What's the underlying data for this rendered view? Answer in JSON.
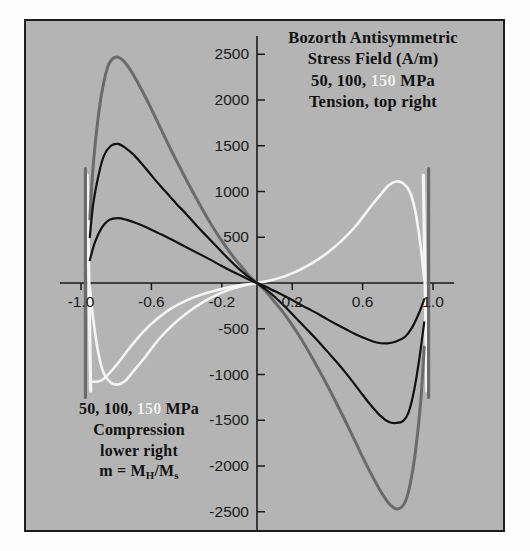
{
  "figure": {
    "background_color": "#b4b4b4",
    "border_color": "#1d1d1d",
    "page_color": "#ffffff"
  },
  "title": {
    "line1": "Bozorth Antisymmetric",
    "line2": "Stress Field (A/m)",
    "line3_part1": "50, 100,",
    "line3_highlight": "150",
    "line3_part2": "MPa",
    "line4": "Tension, top right"
  },
  "note": {
    "line1_part1": "50, 100,",
    "line1_highlight": "150",
    "line1_part2": "MPa",
    "line2": "Compression",
    "line3": "lower right",
    "line4_prefix": "m = M",
    "line4_sub1": "H",
    "line4_mid": "/M",
    "line4_sub2": "s"
  },
  "chart_data": {
    "type": "line",
    "title": "Bozorth Antisymmetric Stress Field (A/m)",
    "xlabel": "m = MH/Ms",
    "ylabel": "Stress Field (A/m)",
    "xlim": [
      -1.12,
      1.12
    ],
    "ylim": [
      -2700,
      2700
    ],
    "grid": false,
    "legend_position": "none",
    "xticks": [
      -1.0,
      -0.6,
      -0.2,
      0.2,
      0.6,
      1.0
    ],
    "xtick_labels": [
      "-1.0",
      "-0.6",
      "-0.2",
      "0.2",
      "0.6",
      "1.0"
    ],
    "yticks": [
      2500,
      2000,
      1500,
      1000,
      500,
      -500,
      -1000,
      -1500,
      -2000,
      -2500
    ],
    "ytick_labels": [
      "2500",
      "2000",
      "1500",
      "1000",
      "500",
      "-500",
      "-1000",
      "-1500",
      "-2000",
      "-2500"
    ],
    "series": [
      {
        "name": "150 MPa (dark)",
        "color": "#6b6b6b",
        "width": 3.0,
        "x": [
          -0.95,
          -0.93,
          -0.9,
          -0.87,
          -0.84,
          -0.8,
          -0.76,
          -0.72,
          -0.68,
          -0.62,
          -0.56,
          -0.5,
          -0.44,
          -0.38,
          -0.32,
          -0.26,
          -0.2,
          -0.14,
          -0.08,
          -0.04,
          0.0
        ],
        "y": [
          700,
          1300,
          1850,
          2200,
          2400,
          2470,
          2430,
          2330,
          2200,
          1980,
          1740,
          1500,
          1270,
          1050,
          840,
          640,
          460,
          300,
          160,
          70,
          0
        ]
      },
      {
        "name": "150 MPa (dark, lower branch)",
        "color": "#6b6b6b",
        "width": 3.0,
        "x": [
          0.0,
          0.04,
          0.08,
          0.14,
          0.2,
          0.26,
          0.32,
          0.38,
          0.44,
          0.5,
          0.56,
          0.62,
          0.68,
          0.72,
          0.76,
          0.8,
          0.84,
          0.87,
          0.9,
          0.93,
          0.95
        ],
        "y": [
          0,
          -70,
          -160,
          -300,
          -460,
          -640,
          -840,
          -1050,
          -1270,
          -1500,
          -1740,
          -1980,
          -2200,
          -2330,
          -2430,
          -2470,
          -2400,
          -2200,
          -1850,
          -1300,
          -700
        ]
      },
      {
        "name": "100 MPa (black)",
        "color": "#111111",
        "width": 2.2,
        "x": [
          -0.95,
          -0.93,
          -0.9,
          -0.87,
          -0.83,
          -0.79,
          -0.75,
          -0.7,
          -0.64,
          -0.58,
          -0.52,
          -0.46,
          -0.4,
          -0.34,
          -0.28,
          -0.22,
          -0.16,
          -0.1,
          -0.05,
          0.0
        ],
        "y": [
          500,
          870,
          1180,
          1390,
          1500,
          1520,
          1480,
          1400,
          1270,
          1130,
          1000,
          870,
          750,
          620,
          500,
          380,
          260,
          150,
          70,
          0
        ]
      },
      {
        "name": "100 MPa (black, lower branch)",
        "color": "#111111",
        "width": 2.2,
        "x": [
          0.0,
          0.05,
          0.1,
          0.16,
          0.22,
          0.28,
          0.34,
          0.4,
          0.46,
          0.52,
          0.58,
          0.64,
          0.7,
          0.75,
          0.79,
          0.83,
          0.86,
          0.89,
          0.92,
          0.95
        ],
        "y": [
          0,
          -70,
          -150,
          -260,
          -380,
          -500,
          -620,
          -750,
          -880,
          -1020,
          -1170,
          -1320,
          -1450,
          -1520,
          -1530,
          -1510,
          -1420,
          -1200,
          -860,
          -430
        ]
      },
      {
        "name": "50 MPa (black, small)",
        "color": "#111111",
        "width": 2.2,
        "x": [
          -0.95,
          -0.92,
          -0.88,
          -0.84,
          -0.79,
          -0.74,
          -0.68,
          -0.62,
          -0.56,
          -0.5,
          -0.44,
          -0.38,
          -0.32,
          -0.26,
          -0.2,
          -0.14,
          -0.08,
          -0.04,
          0.0
        ],
        "y": [
          250,
          450,
          610,
          690,
          710,
          690,
          650,
          600,
          545,
          490,
          430,
          370,
          310,
          250,
          185,
          125,
          70,
          30,
          0
        ]
      },
      {
        "name": "50 MPa (black, small, lower branch)",
        "color": "#111111",
        "width": 2.2,
        "x": [
          0.0,
          0.04,
          0.08,
          0.14,
          0.2,
          0.26,
          0.32,
          0.38,
          0.44,
          0.5,
          0.56,
          0.62,
          0.68,
          0.74,
          0.79,
          0.84,
          0.88,
          0.92,
          0.95
        ],
        "y": [
          0,
          -30,
          -70,
          -125,
          -185,
          -250,
          -310,
          -375,
          -440,
          -500,
          -560,
          -610,
          -650,
          -660,
          -640,
          -590,
          -490,
          -330,
          -180
        ]
      },
      {
        "name": "150 MPa white return branch (upper right)",
        "color": "#f5f5f5",
        "width": 2.6,
        "x": [
          -0.95,
          -0.88,
          -0.8,
          -0.72,
          -0.64,
          -0.56,
          -0.48,
          -0.4,
          -0.32,
          -0.24,
          -0.16,
          -0.08,
          0.0,
          0.08,
          0.16,
          0.24,
          0.32,
          0.4,
          0.48,
          0.56,
          0.64,
          0.7,
          0.75,
          0.79,
          0.83,
          0.87,
          0.9,
          0.93,
          0.95
        ],
        "y": [
          -1080,
          -1060,
          -900,
          -700,
          -520,
          -380,
          -270,
          -190,
          -130,
          -85,
          -48,
          -20,
          0,
          30,
          75,
          140,
          225,
          330,
          460,
          620,
          820,
          960,
          1070,
          1110,
          1090,
          990,
          780,
          400,
          40
        ]
      },
      {
        "name": "150 MPa white return branch (lower left)",
        "color": "#f5f5f5",
        "width": 2.6,
        "x": [
          -0.95,
          -0.93,
          -0.9,
          -0.87,
          -0.83,
          -0.79,
          -0.75,
          -0.7,
          -0.64,
          -0.56,
          -0.48,
          -0.4,
          -0.32,
          -0.24,
          -0.16,
          -0.08,
          0.0
        ],
        "y": [
          -40,
          -400,
          -780,
          -990,
          -1090,
          -1110,
          -1070,
          -960,
          -820,
          -620,
          -460,
          -330,
          -225,
          -140,
          -75,
          -30,
          0
        ]
      },
      {
        "name": "left switching segment (white)",
        "color": "#f5f5f5",
        "width": 3.2,
        "x": [
          -0.965,
          -0.945
        ],
        "y": [
          1180,
          -1180
        ]
      },
      {
        "name": "left switching segment (dark)",
        "color": "#6b6b6b",
        "width": 3.2,
        "x": [
          -0.975,
          -0.975
        ],
        "y": [
          1250,
          -1250
        ]
      },
      {
        "name": "right switching segment (white)",
        "color": "#f5f5f5",
        "width": 3.2,
        "x": [
          0.945,
          0.965
        ],
        "y": [
          1180,
          -1180
        ]
      },
      {
        "name": "right switching segment (dark)",
        "color": "#6b6b6b",
        "width": 3.2,
        "x": [
          0.975,
          0.975
        ],
        "y": [
          1250,
          -1250
        ]
      }
    ]
  }
}
